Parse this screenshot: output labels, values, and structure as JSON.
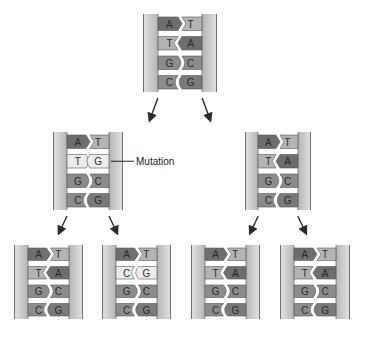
{
  "annotation": {
    "label": "Mutation"
  },
  "colors": {
    "backbone": "#bdbdbd",
    "backbone_edge": "#6f6f6f",
    "base_dark": "#6e6e6e",
    "base_medium": "#8c8c8c",
    "base_light": "#b4b4b4",
    "base_mutant": "#ececec",
    "arrow": "#2b2b2b"
  },
  "molecules": [
    {
      "id": "parent",
      "pairs": [
        [
          "A",
          "T"
        ],
        [
          "T",
          "A"
        ],
        [
          "G",
          "C"
        ],
        [
          "C",
          "G"
        ]
      ],
      "mutated_rows": []
    },
    {
      "id": "gen1-left",
      "pairs": [
        [
          "A",
          "T"
        ],
        [
          "T",
          "G"
        ],
        [
          "G",
          "C"
        ],
        [
          "C",
          "G"
        ]
      ],
      "mutated_rows": [
        1
      ],
      "mismatch_rows": [
        1
      ]
    },
    {
      "id": "gen1-right",
      "pairs": [
        [
          "A",
          "T"
        ],
        [
          "T",
          "A"
        ],
        [
          "G",
          "C"
        ],
        [
          "C",
          "G"
        ]
      ],
      "mutated_rows": []
    },
    {
      "id": "gen2-1",
      "pairs": [
        [
          "A",
          "T"
        ],
        [
          "T",
          "A"
        ],
        [
          "G",
          "C"
        ],
        [
          "C",
          "G"
        ]
      ],
      "mutated_rows": []
    },
    {
      "id": "gen2-2",
      "pairs": [
        [
          "A",
          "T"
        ],
        [
          "C",
          "G"
        ],
        [
          "G",
          "C"
        ],
        [
          "C",
          "G"
        ]
      ],
      "mutated_rows": [
        1
      ]
    },
    {
      "id": "gen2-3",
      "pairs": [
        [
          "A",
          "T"
        ],
        [
          "T",
          "A"
        ],
        [
          "G",
          "C"
        ],
        [
          "C",
          "G"
        ]
      ],
      "mutated_rows": []
    },
    {
      "id": "gen2-4",
      "pairs": [
        [
          "A",
          "T"
        ],
        [
          "T",
          "A"
        ],
        [
          "G",
          "C"
        ],
        [
          "C",
          "G"
        ]
      ],
      "mutated_rows": []
    }
  ],
  "arrows": [
    {
      "from": "parent",
      "to": "gen1-left"
    },
    {
      "from": "parent",
      "to": "gen1-right"
    },
    {
      "from": "gen1-left",
      "to": "gen2-1"
    },
    {
      "from": "gen1-left",
      "to": "gen2-2"
    },
    {
      "from": "gen1-right",
      "to": "gen2-3"
    },
    {
      "from": "gen1-right",
      "to": "gen2-4"
    }
  ]
}
